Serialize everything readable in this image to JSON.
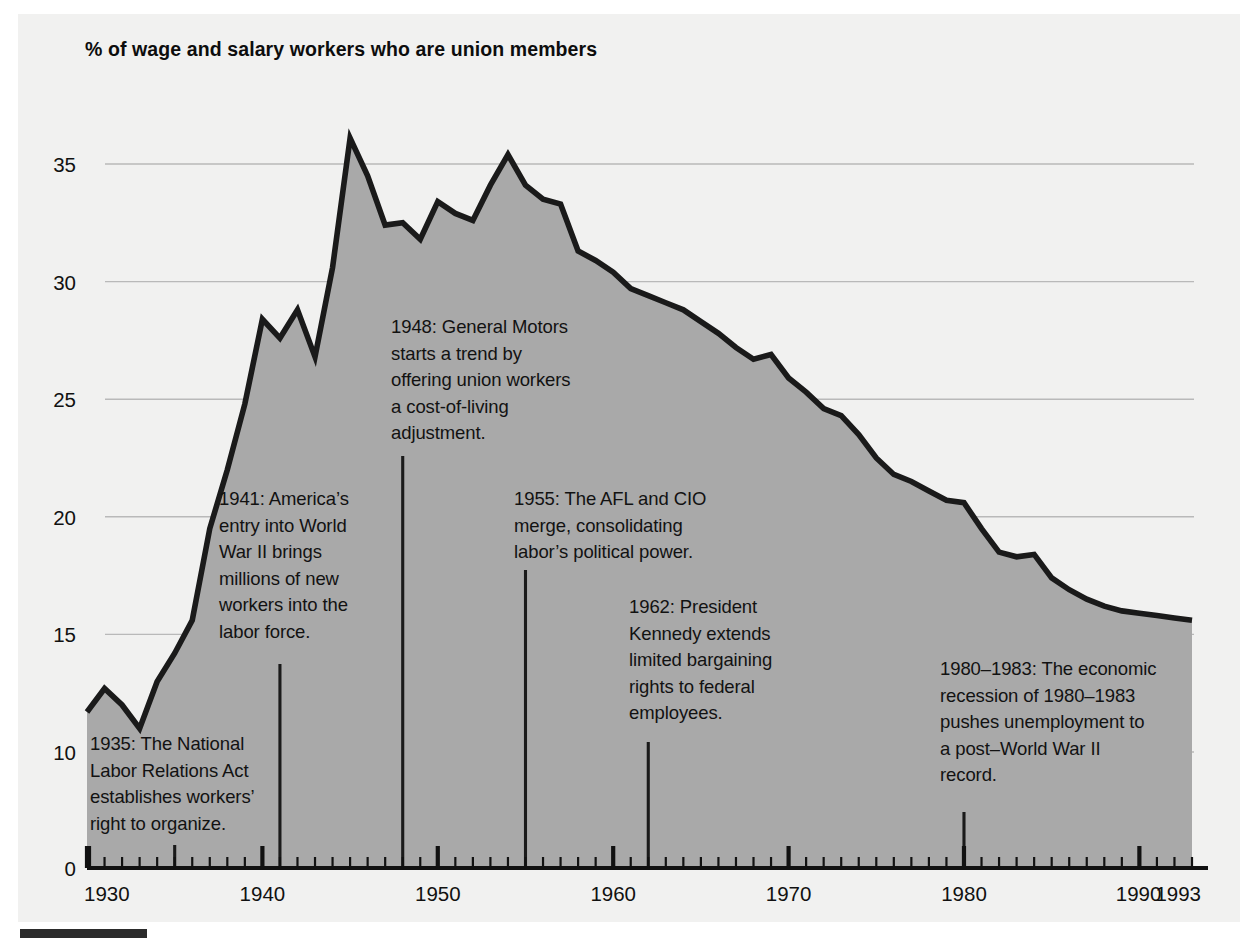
{
  "title": "% of wage and salary workers who are union members",
  "colors": {
    "panel_background": "#f1f1f0",
    "area_fill": "#a9a9a9",
    "line": "#1a1a1a",
    "gridline": "#b9b9b9",
    "axis": "#111111",
    "text": "#121212"
  },
  "chart_data": {
    "type": "area",
    "title": "% of wage and salary workers who are union members",
    "xlabel": "",
    "ylabel": "",
    "xlim": [
      1930,
      1993
    ],
    "ylim": [
      0,
      37.5
    ],
    "grid": "horizontal",
    "legend": "none",
    "y_ticks": [
      0,
      10,
      15,
      20,
      25,
      30,
      35
    ],
    "y_tick_labels": [
      "0",
      "10",
      "15",
      "20",
      "25",
      "30",
      "35"
    ],
    "x_ticks": [
      1930,
      1940,
      1950,
      1960,
      1970,
      1980,
      1990,
      1993
    ],
    "x_tick_labels": [
      "1930",
      "1940",
      "1950",
      "1960",
      "1970",
      "1980",
      "1990",
      "1993"
    ],
    "x_minor_tick_interval": 1,
    "series": [
      {
        "name": "% of wage and salary workers who are union members",
        "x": [
          1930,
          1931,
          1932,
          1933,
          1934,
          1935,
          1936,
          1937,
          1938,
          1939,
          1940,
          1941,
          1942,
          1943,
          1944,
          1945,
          1946,
          1947,
          1948,
          1949,
          1950,
          1951,
          1952,
          1953,
          1954,
          1955,
          1956,
          1957,
          1958,
          1959,
          1960,
          1961,
          1962,
          1963,
          1964,
          1965,
          1966,
          1967,
          1968,
          1969,
          1970,
          1971,
          1972,
          1973,
          1974,
          1975,
          1976,
          1977,
          1978,
          1979,
          1980,
          1981,
          1982,
          1983,
          1984,
          1985,
          1986,
          1987,
          1988,
          1989,
          1990,
          1991,
          1992,
          1993
        ],
        "values": [
          11.7,
          12.7,
          12.0,
          11.0,
          13.0,
          14.2,
          15.6,
          19.5,
          22.0,
          24.8,
          28.4,
          27.6,
          28.8,
          26.8,
          30.6,
          36.1,
          34.5,
          32.4,
          32.5,
          31.8,
          33.4,
          32.9,
          32.6,
          34.1,
          35.4,
          34.1,
          33.5,
          33.3,
          31.3,
          30.9,
          30.4,
          29.7,
          29.4,
          29.1,
          28.8,
          28.3,
          27.8,
          27.2,
          26.7,
          26.9,
          25.9,
          25.3,
          24.6,
          24.3,
          23.5,
          22.5,
          21.8,
          21.5,
          21.1,
          20.7,
          20.6,
          19.5,
          18.5,
          18.3,
          18.4,
          17.4,
          16.9,
          16.5,
          16.2,
          16.0,
          15.9,
          15.8,
          15.7,
          15.6
        ]
      }
    ],
    "annotations": [
      {
        "id": "ann-1935",
        "year": 1935,
        "text": "1935: The National\nLabor Relations Act\nestablishes workers’\nright to organize.",
        "text_left": 90,
        "text_top": 731
      },
      {
        "id": "ann-1941",
        "year": 1941,
        "text": "1941: America’s\nentry into World\nWar II brings\nmillions of new\nworkers into the\nlabor force.",
        "text_left": 219,
        "text_top": 486
      },
      {
        "id": "ann-1948",
        "year": 1948,
        "text": "1948: General Motors\nstarts a trend by\noffering union workers\na cost-of-living\nadjustment.",
        "text_left": 391,
        "text_top": 314
      },
      {
        "id": "ann-1955",
        "year": 1955,
        "text": "1955: The AFL and CIO\nmerge, consolidating\nlabor’s political power.",
        "text_left": 514,
        "text_top": 486
      },
      {
        "id": "ann-1962",
        "year": 1962,
        "text": "1962: President\nKennedy extends\nlimited bargaining\nrights to federal\nemployees.",
        "text_left": 629,
        "text_top": 594
      },
      {
        "id": "ann-1980",
        "year": 1980,
        "text": "1980–1983: The economic\nrecession of 1980–1983\npushes unemployment to\na post–World War II\nrecord.",
        "text_left": 940,
        "text_top": 656
      }
    ]
  }
}
